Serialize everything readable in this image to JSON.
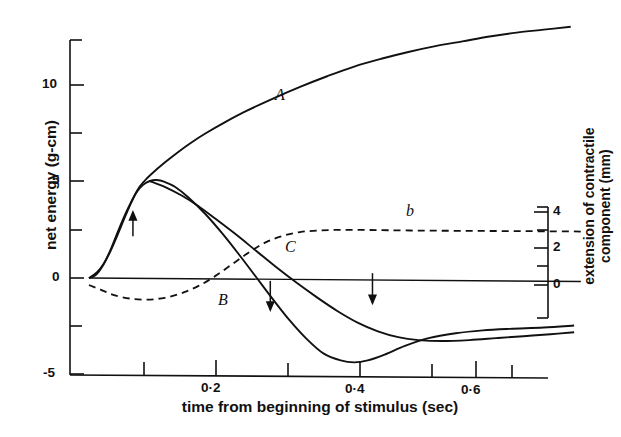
{
  "chart_data": {
    "type": "line",
    "title": "",
    "xlabel": "time from beginning of stimulus (sec)",
    "ylabel_left": "net energy  (g-cm)",
    "ylabel_right_line1": "extension of contractile",
    "ylabel_right_line2": "component (mm)",
    "xlim": [
      0.0,
      0.76
    ],
    "ylim_left": [
      -5,
      12.5
    ],
    "ylim_right": [
      -1.2,
      5.4
    ],
    "grid": false,
    "legend": "none",
    "x_ticks_major": [
      0.2,
      0.4,
      0.6
    ],
    "x_tick_labels": [
      "0·2",
      "0·4",
      "0·6"
    ],
    "x_ticks_minor": [
      0.1,
      0.3,
      0.5,
      0.7
    ],
    "y_ticks_left_major": [
      10,
      5,
      0,
      -5
    ],
    "y_tick_labels_left": [
      "10",
      "5",
      "0",
      "-5"
    ],
    "y_ticks_left_minor": [
      12.5,
      7.5,
      2.5,
      -2.5
    ],
    "y_ticks_right_major": [
      4,
      2,
      0
    ],
    "y_tick_labels_right": [
      "4",
      "2",
      "0"
    ],
    "y_ticks_right_minor": [
      5,
      3,
      1,
      -1
    ],
    "series": [
      {
        "name": "A",
        "label": "A",
        "style": "solid",
        "axis": "left",
        "description": "total energy, monotonically rising",
        "points": [
          [
            0.028,
            0.0
          ],
          [
            0.04,
            0.3
          ],
          [
            0.05,
            0.75
          ],
          [
            0.06,
            1.4
          ],
          [
            0.07,
            2.2
          ],
          [
            0.08,
            3.05
          ],
          [
            0.09,
            3.85
          ],
          [
            0.1,
            4.55
          ],
          [
            0.11,
            5.0
          ],
          [
            0.12,
            5.35
          ],
          [
            0.14,
            5.95
          ],
          [
            0.16,
            6.5
          ],
          [
            0.18,
            7.0
          ],
          [
            0.2,
            7.45
          ],
          [
            0.23,
            8.05
          ],
          [
            0.26,
            8.6
          ],
          [
            0.3,
            9.25
          ],
          [
            0.34,
            9.85
          ],
          [
            0.38,
            10.4
          ],
          [
            0.42,
            10.9
          ],
          [
            0.46,
            11.3
          ],
          [
            0.5,
            11.65
          ],
          [
            0.54,
            11.95
          ],
          [
            0.58,
            12.2
          ],
          [
            0.62,
            12.45
          ],
          [
            0.66,
            12.65
          ],
          [
            0.7,
            12.8
          ],
          [
            0.74,
            12.95
          ]
        ]
      },
      {
        "name": "B",
        "label": "B",
        "style": "solid",
        "axis": "left",
        "description": "net energy, peaks near 5 then falls to minimum about -4.3",
        "points": [
          [
            0.028,
            0.0
          ],
          [
            0.038,
            0.15
          ],
          [
            0.048,
            0.6
          ],
          [
            0.058,
            1.3
          ],
          [
            0.068,
            2.15
          ],
          [
            0.078,
            3.0
          ],
          [
            0.088,
            3.75
          ],
          [
            0.098,
            4.4
          ],
          [
            0.108,
            4.8
          ],
          [
            0.118,
            5.0
          ],
          [
            0.128,
            5.05
          ],
          [
            0.14,
            4.95
          ],
          [
            0.155,
            4.7
          ],
          [
            0.175,
            4.15
          ],
          [
            0.2,
            3.3
          ],
          [
            0.225,
            2.3
          ],
          [
            0.25,
            1.2
          ],
          [
            0.275,
            0.05
          ],
          [
            0.3,
            -1.1
          ],
          [
            0.325,
            -2.2
          ],
          [
            0.35,
            -3.15
          ],
          [
            0.375,
            -3.9
          ],
          [
            0.4,
            -4.25
          ],
          [
            0.42,
            -4.35
          ],
          [
            0.44,
            -4.25
          ],
          [
            0.465,
            -3.95
          ],
          [
            0.495,
            -3.5
          ],
          [
            0.53,
            -3.1
          ],
          [
            0.57,
            -2.85
          ],
          [
            0.61,
            -2.7
          ],
          [
            0.65,
            -2.62
          ],
          [
            0.7,
            -2.55
          ],
          [
            0.745,
            -2.45
          ]
        ]
      },
      {
        "name": "C",
        "label": "C",
        "style": "solid",
        "axis": "left",
        "description": "work curve, descends through zero to shallow minimum then rises slightly",
        "points": [
          [
            0.118,
            5.0
          ],
          [
            0.14,
            4.7
          ],
          [
            0.165,
            4.25
          ],
          [
            0.19,
            3.7
          ],
          [
            0.215,
            3.05
          ],
          [
            0.245,
            2.25
          ],
          [
            0.275,
            1.4
          ],
          [
            0.305,
            0.55
          ],
          [
            0.335,
            -0.25
          ],
          [
            0.365,
            -1.0
          ],
          [
            0.395,
            -1.7
          ],
          [
            0.425,
            -2.3
          ],
          [
            0.455,
            -2.75
          ],
          [
            0.485,
            -3.05
          ],
          [
            0.515,
            -3.2
          ],
          [
            0.55,
            -3.25
          ],
          [
            0.59,
            -3.2
          ],
          [
            0.63,
            -3.1
          ],
          [
            0.67,
            -3.0
          ],
          [
            0.71,
            -2.9
          ],
          [
            0.745,
            -2.8
          ]
        ]
      },
      {
        "name": "b",
        "label": "b",
        "style": "dashed",
        "axis": "right",
        "description": "extension of contractile component (mm), dips slightly negative then rises to plateau near 3 mm",
        "points": [
          [
            0.028,
            0.0
          ],
          [
            0.045,
            -0.25
          ],
          [
            0.065,
            -0.55
          ],
          [
            0.09,
            -0.75
          ],
          [
            0.115,
            -0.8
          ],
          [
            0.14,
            -0.7
          ],
          [
            0.165,
            -0.45
          ],
          [
            0.19,
            -0.05
          ],
          [
            0.215,
            0.5
          ],
          [
            0.24,
            1.15
          ],
          [
            0.265,
            1.8
          ],
          [
            0.29,
            2.35
          ],
          [
            0.315,
            2.7
          ],
          [
            0.34,
            2.9
          ],
          [
            0.365,
            2.98
          ],
          [
            0.395,
            3.02
          ],
          [
            0.43,
            3.02
          ],
          [
            0.47,
            3.0
          ],
          [
            0.52,
            2.98
          ],
          [
            0.57,
            2.97
          ],
          [
            0.62,
            2.96
          ],
          [
            0.67,
            2.95
          ],
          [
            0.72,
            2.94
          ],
          [
            0.755,
            2.93
          ]
        ]
      },
      {
        "name": "zero-line",
        "label": "",
        "style": "solid",
        "axis": "left",
        "description": "near-horizontal baseline drawn from origin to right axis",
        "points": [
          [
            0.028,
            0.0
          ],
          [
            0.755,
            -0.18
          ]
        ]
      }
    ],
    "annotations": [
      {
        "name": "arrow-up-1",
        "glyph": "arrow-up",
        "x": 0.093,
        "y_top": 2.15,
        "y_bottom": 3.4
      },
      {
        "name": "arrow-down-1",
        "glyph": "arrow-down",
        "x": 0.296,
        "y_top": -0.15,
        "y_bottom": -1.65
      },
      {
        "name": "arrow-down-2",
        "glyph": "arrow-down",
        "x": 0.447,
        "y_top": 0.25,
        "y_bottom": -1.3
      }
    ],
    "curve_label_positions": [
      {
        "label": "A",
        "x": 275,
        "y": 95
      },
      {
        "label": "B",
        "x": 220,
        "y": 300
      },
      {
        "label": "C",
        "x": 286,
        "y": 247
      },
      {
        "label": "b",
        "x": 408,
        "y": 210
      }
    ]
  },
  "axes": {
    "left_title": "net energy  (g-cm)",
    "right_title_line1": "extension of contractile",
    "right_title_line2": "component (mm)",
    "bottom_title": "time from beginning of stimulus (sec)"
  }
}
